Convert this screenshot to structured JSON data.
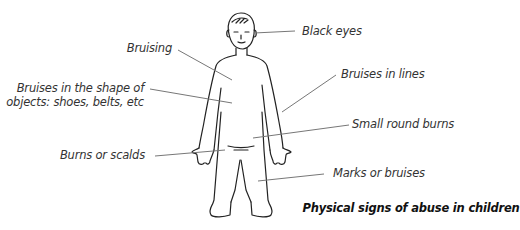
{
  "caption": "Physical signs of abuse in children",
  "labels": {
    "black_eyes": "Black eyes",
    "bruising": "Bruising",
    "bruises_shape_line1": "Bruises in the shape of",
    "bruises_shape_line2": "objects: shoes, belts, etc",
    "bruises_lines": "Bruises in lines",
    "small_round_burns": "Small round burns",
    "burns_scalds": "Burns or scalds",
    "marks_bruises": "Marks or bruises"
  },
  "colors": {
    "outline": "#222222",
    "leader_line": "#777777",
    "label_text": "#333333",
    "caption_text": "#111111"
  }
}
